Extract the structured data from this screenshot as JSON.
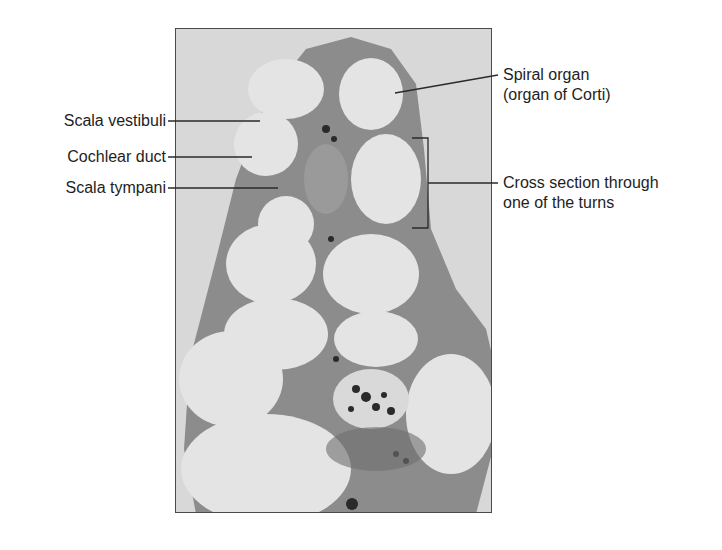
{
  "figure": {
    "colors": {
      "background": "#ffffff",
      "micrograph_background": "#d6d6d6",
      "bone_tissue": "#8a8a8a",
      "fluid_space": "#e6e6e6",
      "dark_cells": "#2a2a2a",
      "text": "#1e1e1e",
      "leader_line": "#2a2a2a"
    },
    "labels_left": [
      {
        "text": "Scala vestibuli"
      },
      {
        "text": "Cochlear duct"
      },
      {
        "text": "Scala tympani"
      }
    ],
    "labels_right": [
      {
        "line1": "Spiral organ",
        "line2": "(organ of Corti)"
      },
      {
        "line1": "Cross section through",
        "line2": "one of the turns"
      }
    ]
  }
}
